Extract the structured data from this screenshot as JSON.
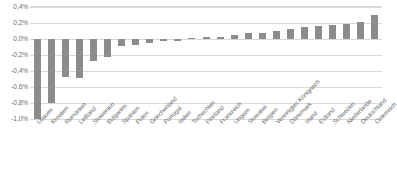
{
  "chart_data": {
    "type": "bar",
    "title": "",
    "subtitle": "",
    "xlabel": "",
    "ylabel": "",
    "ylim": [
      -1.0,
      0.4
    ],
    "ytick_values": [
      0.4,
      0.2,
      0.0,
      -0.2,
      -0.4,
      -0.6,
      -0.8,
      -1.0
    ],
    "ytick_labels": [
      "0,4%",
      "0,2%",
      "0,0%",
      "-0,2%",
      "-0,4%",
      "-0,6%",
      "-0,8%",
      "-1,0%"
    ],
    "grid": true,
    "legend": null,
    "bar_color": "#8c8c8c",
    "gridline_color": "#d9d9d9",
    "axis_label_color": "#6e6e6e",
    "categories": [
      "Litauen",
      "Kroatien",
      "Rumänien",
      "Lettland",
      "Slowenien",
      "Bulgarien",
      "Spanien",
      "Polen",
      "Griechenland",
      "Portugal",
      "Italien",
      "Tschechien",
      "Finnland",
      "Frankreich",
      "Ungarn",
      "Slowakei",
      "Belgien",
      "Vereinigtes Königreich",
      "Dänemark",
      "Irland",
      "Estland",
      "Schweden",
      "Niederlande",
      "Deutschland",
      "Österreich"
    ],
    "values": [
      -1.0,
      -0.8,
      -0.47,
      -0.49,
      -0.28,
      -0.23,
      -0.09,
      -0.07,
      -0.05,
      -0.03,
      -0.02,
      0.01,
      0.02,
      0.03,
      0.05,
      0.07,
      0.08,
      0.1,
      0.13,
      0.15,
      0.16,
      0.17,
      0.19,
      0.21,
      0.3
    ]
  }
}
